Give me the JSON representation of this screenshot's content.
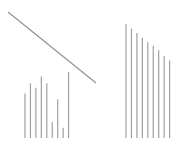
{
  "colors": {
    "background": "#ffffff",
    "bar": "#a0a0a0",
    "line": "#909090"
  },
  "chart_data": [
    {
      "type": "bar",
      "name": "left-bar-group",
      "categories": [
        "1",
        "2",
        "3",
        "4",
        "5",
        "6",
        "7",
        "8",
        "9"
      ],
      "values": [
        0.39,
        0.48,
        0.44,
        0.54,
        0.48,
        0.14,
        0.34,
        0.09,
        0.58
      ],
      "title": "",
      "xlabel": "",
      "ylabel": "",
      "ylim": [
        0,
        1
      ],
      "grid": false
    },
    {
      "type": "line",
      "name": "diagonal-line",
      "x": [
        0,
        1
      ],
      "y": [
        1,
        0
      ],
      "title": "",
      "xlabel": "",
      "ylabel": "",
      "grid": false
    },
    {
      "type": "bar",
      "name": "right-bar-group",
      "categories": [
        "1",
        "2",
        "3",
        "4",
        "5",
        "6",
        "7",
        "8",
        "9"
      ],
      "values": [
        1.0,
        0.96,
        0.92,
        0.88,
        0.84,
        0.81,
        0.77,
        0.72,
        0.68
      ],
      "title": "",
      "xlabel": "",
      "ylabel": "",
      "ylim": [
        0,
        1
      ],
      "grid": false
    }
  ]
}
